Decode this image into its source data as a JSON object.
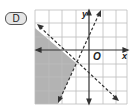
{
  "choice": {
    "label": "D"
  },
  "graph": {
    "axis_labels": {
      "x": "x",
      "y": "y",
      "origin": "O"
    },
    "grid": {
      "columns": 7,
      "rows": 7,
      "origin_col": 4,
      "origin_row": 3
    },
    "lines": [
      {
        "name": "negative-slope-boundary",
        "style": "dashed",
        "direction": "down-right"
      },
      {
        "name": "positive-slope-boundary",
        "style": "dashed",
        "direction": "up-right"
      }
    ],
    "shaded_region": "left of steep line and below negative-slope line",
    "colors": {
      "shade": "#b3b3b3",
      "grid": "#bdbdbd",
      "axes": "#333333",
      "lines": "#333333"
    }
  }
}
